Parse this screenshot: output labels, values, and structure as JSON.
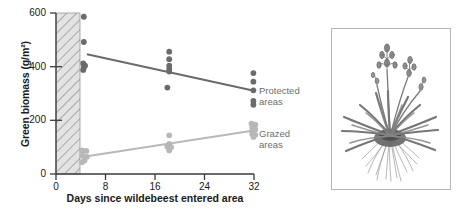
{
  "figure": {
    "panels": [
      "chart",
      "plant-illustration"
    ]
  },
  "chart_data": {
    "type": "scatter",
    "title": "",
    "xlabel": "Days since wildebeest entered area",
    "ylabel": "Green biomass (g/m²)",
    "xlim": [
      0,
      33
    ],
    "ylim": [
      0,
      600
    ],
    "xticks": [
      0,
      8,
      16,
      24,
      32
    ],
    "yticks": [
      0,
      200,
      400,
      600
    ],
    "xtick_labels": [
      "0",
      "8",
      "16",
      "24",
      "32"
    ],
    "ytick_labels": [
      "0",
      "200",
      "400",
      "600"
    ],
    "grid": false,
    "legend_position": "right-inline",
    "shaded_band": {
      "label": "grazing period",
      "x_start": 0,
      "x_end": 4.4,
      "fill": "#e0e0e0",
      "hatch": "diagonal"
    },
    "series": [
      {
        "name": "Protected areas",
        "color": "#6b6b6b",
        "marker": "circle",
        "points": [
          {
            "x": 4.5,
            "y": 586
          },
          {
            "x": 4.5,
            "y": 492
          },
          {
            "x": 4.4,
            "y": 412
          },
          {
            "x": 4.7,
            "y": 404
          },
          {
            "x": 4.5,
            "y": 396
          },
          {
            "x": 4.4,
            "y": 388
          },
          {
            "x": 18.3,
            "y": 456
          },
          {
            "x": 18.3,
            "y": 428
          },
          {
            "x": 18.3,
            "y": 404
          },
          {
            "x": 18.3,
            "y": 392
          },
          {
            "x": 18.3,
            "y": 382
          },
          {
            "x": 18.0,
            "y": 322
          },
          {
            "x": 31.9,
            "y": 376
          },
          {
            "x": 31.9,
            "y": 344
          },
          {
            "x": 31.9,
            "y": 312
          },
          {
            "x": 31.9,
            "y": 272
          },
          {
            "x": 31.9,
            "y": 258
          }
        ],
        "trend": {
          "x0": 5.0,
          "y0": 446,
          "x1": 32.0,
          "y1": 310
        }
      },
      {
        "name": "Grazed areas",
        "color": "#b8b8b8",
        "marker": "circle",
        "points": [
          {
            "x": 4.2,
            "y": 88
          },
          {
            "x": 4.9,
            "y": 86
          },
          {
            "x": 4.3,
            "y": 68
          },
          {
            "x": 5.0,
            "y": 64
          },
          {
            "x": 4.6,
            "y": 50
          },
          {
            "x": 4.2,
            "y": 44
          },
          {
            "x": 18.3,
            "y": 144
          },
          {
            "x": 18.3,
            "y": 112
          },
          {
            "x": 18.0,
            "y": 102
          },
          {
            "x": 18.6,
            "y": 100
          },
          {
            "x": 18.3,
            "y": 88
          },
          {
            "x": 31.6,
            "y": 188
          },
          {
            "x": 32.2,
            "y": 184
          },
          {
            "x": 31.7,
            "y": 172
          },
          {
            "x": 32.2,
            "y": 166
          },
          {
            "x": 31.7,
            "y": 150
          },
          {
            "x": 32.2,
            "y": 146
          },
          {
            "x": 31.9,
            "y": 138
          }
        ],
        "trend": {
          "x0": 5.0,
          "y0": 66,
          "x1": 32.0,
          "y1": 162
        }
      }
    ],
    "annotations": [
      {
        "text": "Protected\nareas",
        "series": "Protected areas"
      },
      {
        "text": "Grazed\nareas",
        "series": "Grazed areas"
      }
    ]
  },
  "illustration": {
    "name": "grass-plant-illustration",
    "description": "botanical drawing of a tufted grass plant with flowering stalks and roots"
  }
}
